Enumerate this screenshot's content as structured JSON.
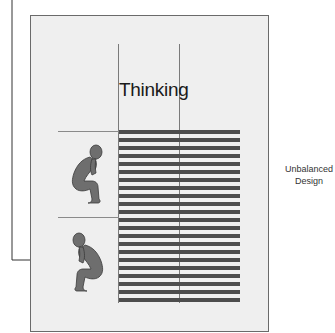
{
  "diagram": {
    "title": "Thinking",
    "side_label_line1": "Unbalanced",
    "side_label_line2": "Design",
    "stripe_count": 22,
    "colors": {
      "page_bg": "#efefef",
      "stripe": "#4d4d4d",
      "figure": "#6e6e6e",
      "lines": "#7a7a7a"
    },
    "figures": [
      {
        "name": "thinker-facing-right"
      },
      {
        "name": "thinker-facing-left"
      }
    ]
  }
}
